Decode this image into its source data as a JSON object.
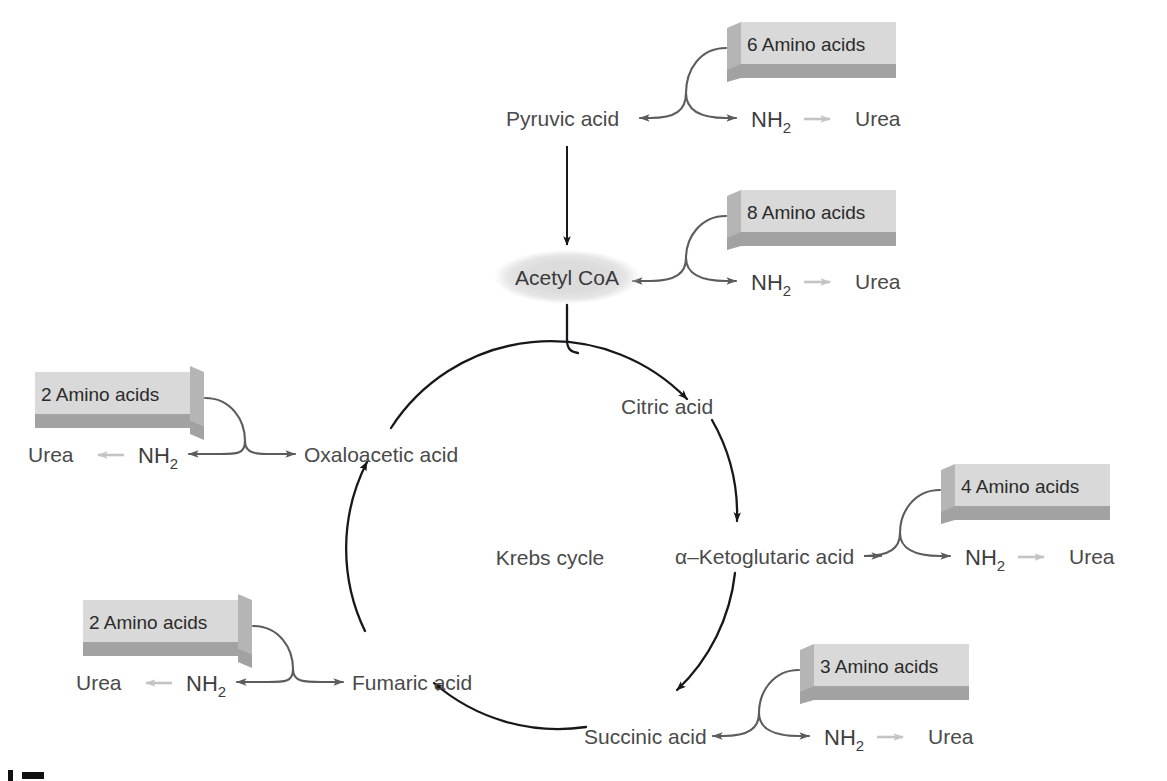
{
  "diagram": {
    "center_label": "Krebs cycle",
    "type": "metabolic-pathway-cycle",
    "colors": {
      "box_top": "#d9d9d9",
      "box_bottom": "#a2a2a2",
      "cycle_arrow": "#18181a",
      "branch_arrow": "#5c5c5c",
      "urea_arrow": "#c4c4c4",
      "text": "#4a4a4a",
      "node_fill": "#dcdcdc",
      "background": "#ffffff"
    },
    "nodes": {
      "pyruvic": "Pyruvic acid",
      "acetyl": "Acetyl CoA",
      "citric": "Citric acid",
      "ketoglutaric": "α–Ketoglutaric acid",
      "succinic": "Succinic acid",
      "fumaric": "Fumaric acid",
      "oxaloacetic": "Oxaloacetic acid"
    },
    "cycle_order": [
      "Citric acid",
      "α–Ketoglutaric acid",
      "Succinic acid",
      "Fumaric acid",
      "Oxaloacetic acid"
    ],
    "entry_points": [
      {
        "id": "pyruvic",
        "box_label": "6 Amino acids",
        "amino_acid_count": 6,
        "target": "Pyruvic acid",
        "byproduct": "NH2",
        "byproduct_display": "NH",
        "byproduct_sub": "2",
        "end_product": "Urea",
        "side": "right"
      },
      {
        "id": "acetyl",
        "box_label": "8 Amino acids",
        "amino_acid_count": 8,
        "target": "Acetyl CoA",
        "byproduct": "NH2",
        "byproduct_display": "NH",
        "byproduct_sub": "2",
        "end_product": "Urea",
        "side": "right"
      },
      {
        "id": "ketoglutaric",
        "box_label": "4 Amino acids",
        "amino_acid_count": 4,
        "target": "α–Ketoglutaric acid",
        "byproduct": "NH2",
        "byproduct_display": "NH",
        "byproduct_sub": "2",
        "end_product": "Urea",
        "side": "right"
      },
      {
        "id": "succinic",
        "box_label": "3 Amino acids",
        "amino_acid_count": 3,
        "target": "Succinic acid",
        "byproduct": "NH2",
        "byproduct_display": "NH",
        "byproduct_sub": "2",
        "end_product": "Urea",
        "side": "right"
      },
      {
        "id": "fumaric",
        "box_label": "2 Amino acids",
        "amino_acid_count": 2,
        "target": "Fumaric acid",
        "byproduct": "NH2",
        "byproduct_display": "NH",
        "byproduct_sub": "2",
        "end_product": "Urea",
        "side": "left"
      },
      {
        "id": "oxaloacetic",
        "box_label": "2 Amino acids",
        "amino_acid_count": 2,
        "target": "Oxaloacetic acid",
        "byproduct": "NH2",
        "byproduct_display": "NH",
        "byproduct_sub": "2",
        "end_product": "Urea",
        "side": "left"
      }
    ]
  }
}
